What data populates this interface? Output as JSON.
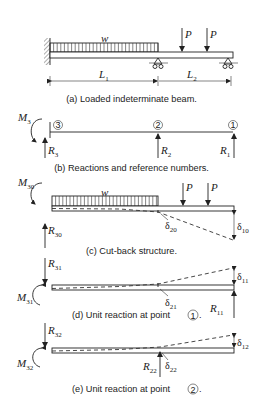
{
  "figure": {
    "panels": [
      {
        "id": "a",
        "caption": "(a) Loaded indeterminate beam.",
        "load_label": "w",
        "point_loads": [
          "P",
          "P"
        ],
        "span_labels": [
          "L",
          "L"
        ],
        "span_subscripts": [
          "1",
          "2"
        ]
      },
      {
        "id": "b",
        "caption": "(b) Reactions and reference numbers.",
        "moment": {
          "sym": "M",
          "sub": "3"
        },
        "points": [
          "3",
          "2",
          "1"
        ],
        "reactions": [
          {
            "sym": "R",
            "sub": "3"
          },
          {
            "sym": "R",
            "sub": "2"
          },
          {
            "sym": "R",
            "sub": "1"
          }
        ]
      },
      {
        "id": "c",
        "caption": "(c) Cut-back structure.",
        "moment": {
          "sym": "M",
          "sub": "30"
        },
        "reaction": {
          "sym": "R",
          "sub": "30"
        },
        "load_label": "w",
        "point_loads": [
          "P",
          "P"
        ],
        "deflections": [
          {
            "sym": "δ",
            "sub": "20"
          },
          {
            "sym": "δ",
            "sub": "10"
          }
        ]
      },
      {
        "id": "d",
        "caption": "(d) Unit reaction at point",
        "caption_point": "1",
        "reaction_top": {
          "sym": "R",
          "sub": "31"
        },
        "moment": {
          "sym": "M",
          "sub": "31"
        },
        "reaction_end": {
          "sym": "R",
          "sub": "11"
        },
        "deflections": [
          {
            "sym": "δ",
            "sub": "21"
          },
          {
            "sym": "δ",
            "sub": "11"
          }
        ]
      },
      {
        "id": "e",
        "caption": "(e) Unit reaction at point",
        "caption_point": "2",
        "reaction_top": {
          "sym": "R",
          "sub": "32"
        },
        "moment": {
          "sym": "M",
          "sub": "32"
        },
        "reaction_mid": {
          "sym": "R",
          "sub": "22"
        },
        "deflections": [
          {
            "sym": "δ",
            "sub": "22"
          },
          {
            "sym": "δ",
            "sub": "12"
          }
        ]
      }
    ]
  }
}
